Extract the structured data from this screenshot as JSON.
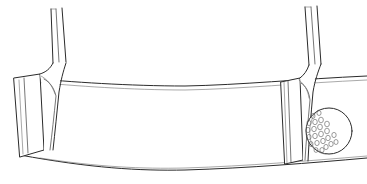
{
  "figure": {
    "background_color": "#ffffff",
    "line_color": "#2b2b2b",
    "shading_color": "#5a5a5a",
    "canvas": {
      "width": 367,
      "height": 184
    }
  },
  "objects": {
    "club_head": {
      "name": "putter-head",
      "top_edge": {
        "left_x": 28,
        "left_y": 78,
        "mid_x": 185,
        "mid_y": 86,
        "right_x": 367,
        "right_y": 76
      },
      "bottom_edge": {
        "left_x": 20,
        "left_y": 155,
        "mid_x": 185,
        "mid_y": 170,
        "right_x": 367,
        "right_y": 158
      },
      "curvature": "shallow downward arc"
    },
    "left_assembly": {
      "name": "left-putter",
      "face_panel": {
        "x": 14,
        "y": 74,
        "width": 26,
        "height": 88
      },
      "hosel_junction_x": 52,
      "hosel_junction_y": 80,
      "shaft_top_x": 57,
      "shaft_top_y": 8
    },
    "right_assembly": {
      "name": "right-putter",
      "face_panel": {
        "x": 281,
        "y": 78,
        "width": 22,
        "height": 86
      },
      "hosel_junction_x": 310,
      "hosel_junction_y": 76,
      "shaft_top_x": 307,
      "shaft_top_y": 6
    },
    "golf_ball": {
      "name": "golf-ball",
      "center_x": 329,
      "center_y": 131,
      "radius": 23,
      "dimples_visible": true,
      "shading_side": "left"
    },
    "shaft": {
      "line_count": 3,
      "style": "tubular outline"
    }
  }
}
